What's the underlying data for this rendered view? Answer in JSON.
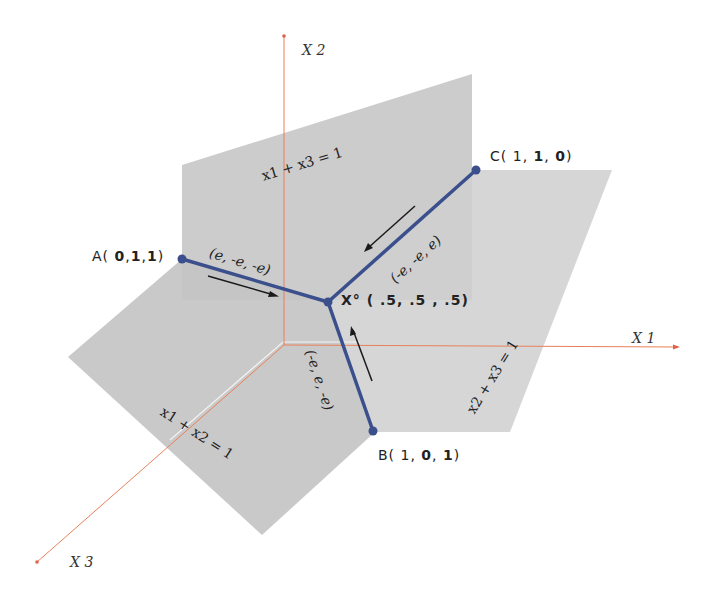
{
  "diagram": {
    "axes": {
      "x1": {
        "label": "X 1"
      },
      "x2": {
        "label": "X 2"
      },
      "x3": {
        "label": "X 3"
      },
      "color": "#e8805a"
    },
    "planes": {
      "upper": {
        "label": "x1 + x3 = 1"
      },
      "right": {
        "label": "x2 + x3 = 1"
      },
      "lower": {
        "label": "x1 + x2 = 1"
      },
      "fill_color": "#c8c8c8"
    },
    "points": {
      "a": {
        "name": "A",
        "open": "(",
        "coords": [
          "0",
          "1",
          "1"
        ],
        "close": ")"
      },
      "b": {
        "name": "B",
        "open": "(",
        "coords": [
          "1",
          "0",
          "1"
        ],
        "close": ")"
      },
      "c": {
        "name": "C",
        "open": "(",
        "coords": [
          "1",
          "1",
          "0"
        ],
        "close": ")"
      },
      "center": {
        "label": "X° ( .5,  .5 , .5)"
      },
      "color": "#3a4f8c"
    },
    "directions": {
      "a_to_center": "(e,  -e,   -e)",
      "c_to_center": "(-e,  -e,   e)",
      "b_to_center": "(-e,  e,  -e)"
    }
  }
}
